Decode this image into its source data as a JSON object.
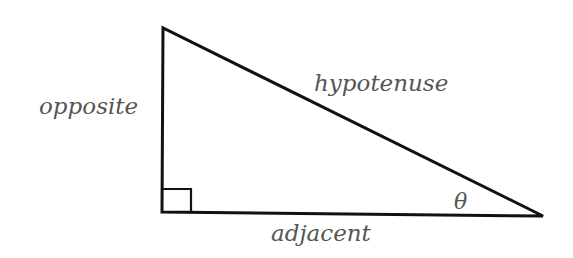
{
  "diagram": {
    "labels": {
      "opposite": "opposite",
      "hypotenuse": "hypotenuse",
      "adjacent": "adjacent",
      "angle": "θ"
    },
    "colors": {
      "stroke": "#111111",
      "text": "#555555",
      "background": "#ffffff"
    }
  }
}
